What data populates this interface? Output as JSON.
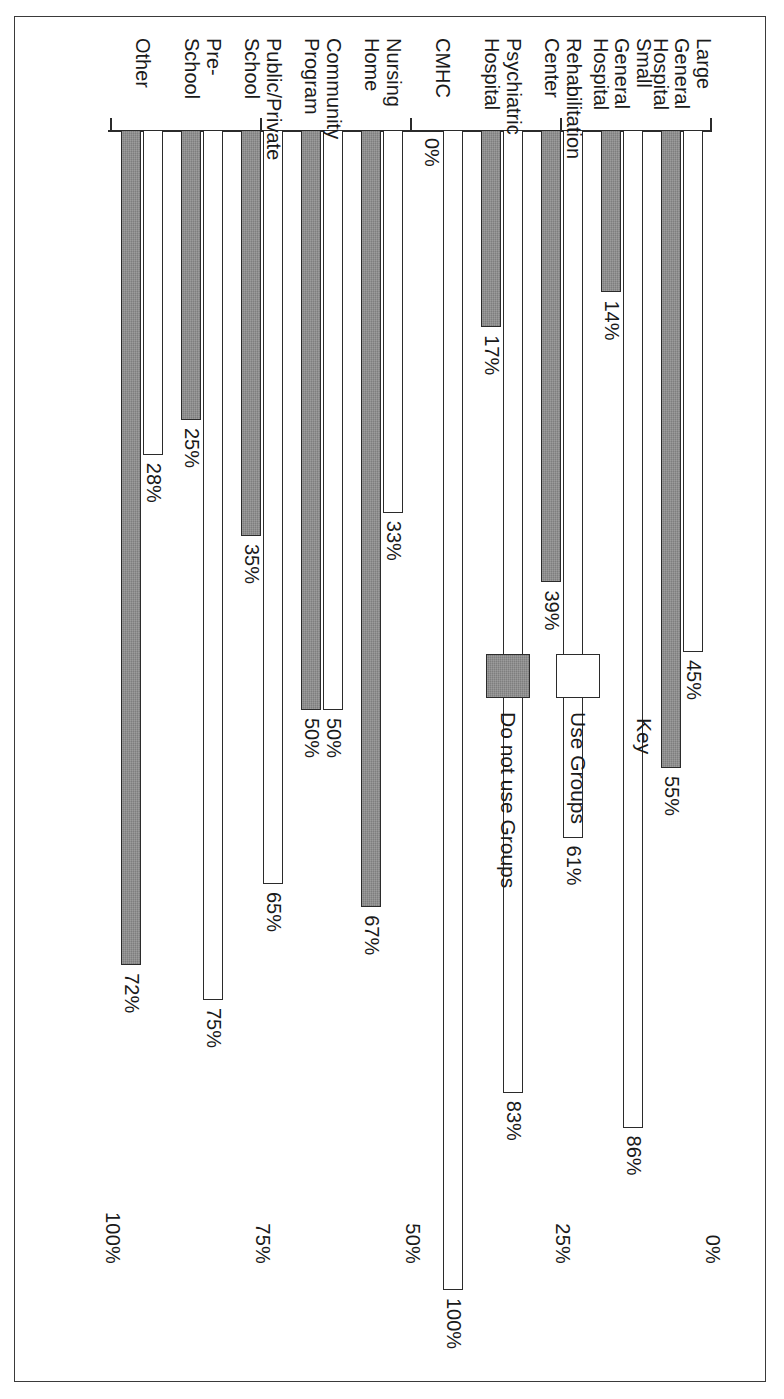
{
  "chart_data": {
    "type": "bar",
    "orientation": "horizontal",
    "title": "",
    "xlabel": "",
    "ylabel": "",
    "xlim": [
      0,
      100
    ],
    "grid": false,
    "axis_ticks": [
      "0%",
      "25%",
      "50%",
      "75%",
      "100%"
    ],
    "categories": [
      "Large\nGeneral\nHospital",
      "Small\nGeneral\nHospital",
      "Rehabilitation\nCenter",
      "Psychiatric\nHospital",
      "CMHC",
      "Nursing\nHome",
      "Community\nProgram",
      "Public/Private\nSchool",
      "Pre-School",
      "Other"
    ],
    "series": [
      {
        "name": "Use Groups",
        "style": "light",
        "values": [
          45,
          86,
          61,
          83,
          100,
          33,
          50,
          65,
          75,
          28
        ],
        "labels": [
          "45%",
          "86%",
          "61%",
          "83%",
          "100%",
          "33%",
          "50%",
          "65%",
          "75%",
          "28%"
        ]
      },
      {
        "name": "Do not use Groups",
        "style": "dark",
        "values": [
          55,
          14,
          39,
          17,
          0,
          67,
          50,
          35,
          25,
          72
        ],
        "labels": [
          "55%",
          "14%",
          "39%",
          "17%",
          "0%",
          "67%",
          "50%",
          "35%",
          "25%",
          "72%"
        ]
      }
    ],
    "legend": {
      "position": "upper-middle",
      "title": "Key",
      "entries": [
        {
          "label": "Use Groups",
          "style": "light"
        },
        {
          "label": "Do not use Groups",
          "style": "dark"
        }
      ]
    },
    "colors": {
      "light_fill": "#ffffff",
      "dark_fill": "#8c8c8c",
      "outline": "#2b2b2b",
      "background": "#ffffff"
    }
  }
}
